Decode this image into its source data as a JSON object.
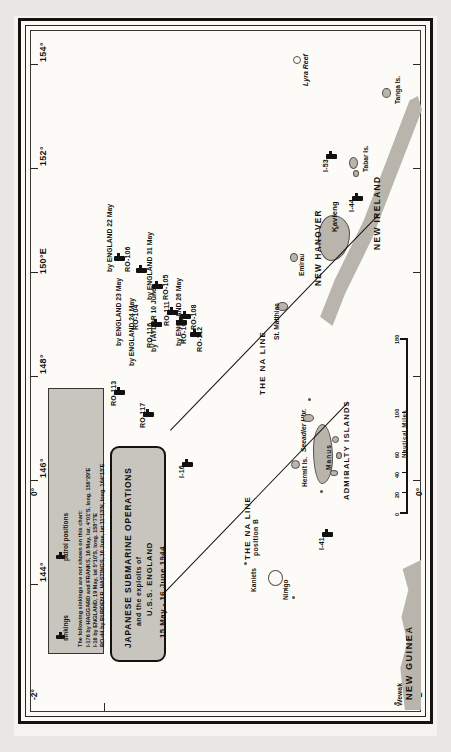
{
  "document": {
    "kind": "historical-naval-chart",
    "orientation_note": "map printed sideways; labels read bottom-to-top"
  },
  "title_box": {
    "line1": "JAPANESE SUBMARINE OPERATIONS",
    "line2": "and the exploits of",
    "line3": "U.S.S. ENGLAND",
    "line4": "15 May - 16 June 1944"
  },
  "legend_box": {
    "symbol_sinkings_label": "sinkings",
    "symbol_patrol_label": "patrol positions",
    "note_lines": [
      "The following sinkings are not shown on this chart:",
      "I-176 by HAGGARD and FRANKS, 16 May, lat. 4°01'S, long. 156°29'E",
      "I-16 by ENGLAND, 19 May, lat 5°10'S, long. 158°7'E",
      "RO-44 by BURDEN R. HASTINGS, 16 June, lat 11°13'N, long. 164°15'E"
    ]
  },
  "graticule": {
    "longitude_labels": [
      "154°",
      "152°",
      "150°E",
      "148°",
      "146°",
      "144°"
    ],
    "latitude_labels": [
      "-2°",
      "-2°",
      "0°",
      "0°"
    ]
  },
  "scale": {
    "caption": "Nautical Miles",
    "ticks": [
      "0",
      "20",
      "40",
      "60",
      "100",
      "180"
    ]
  },
  "na_line": {
    "label": "THE NA LINE",
    "label_b": "THE NA LINE",
    "position_b": "position B"
  },
  "submarines": [
    {
      "name": "RO-106",
      "sunk_by": "by ENGLAND 22 May"
    },
    {
      "name": "RO-104",
      "sunk_by": "by ENGLAND 23 May"
    },
    {
      "name": "RO-105",
      "sunk_by": "by ENGLAND 31 May"
    },
    {
      "name": "RO-116",
      "sunk_by": "by ENGLAND 24 May"
    },
    {
      "name": "RO-108",
      "sunk_by": "by ENGLAND 26 May"
    },
    {
      "name": "RO-111",
      "sunk_by": "by TAYLOR 10 June"
    },
    {
      "name": "RO-107",
      "sunk_by": ""
    },
    {
      "name": "RO-112",
      "sunk_by": ""
    },
    {
      "name": "RO-113",
      "sunk_by": ""
    },
    {
      "name": "RO-117",
      "sunk_by": ""
    },
    {
      "name": "I-16",
      "sunk_by": ""
    },
    {
      "name": "I-44",
      "sunk_by": ""
    },
    {
      "name": "I-53",
      "sunk_by": ""
    },
    {
      "name": "I-41",
      "sunk_by": ""
    }
  ],
  "places": {
    "major": [
      "NEW GUINEA",
      "NEW IRELAND",
      "NEW HANOVER",
      "ADMIRALTY ISLANDS"
    ],
    "minor": [
      "Lyra Reef",
      "Tanga Is.",
      "Tabar Is.",
      "Kavieng",
      "Emirau",
      "St. Matthias",
      "Seeadler Hbr.",
      "Manus",
      "Hermit Is.",
      "Ninigo",
      "Kaniets",
      "Wewak"
    ]
  }
}
